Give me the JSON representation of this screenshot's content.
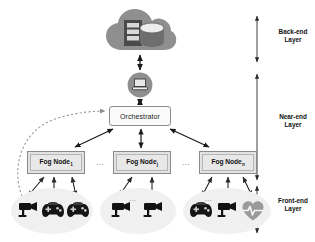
{
  "diagram": {
    "backend": {
      "cloud_icon": "cloud-icon",
      "server_icon": "server-rack-icon",
      "database_icon": "database-cylinder-icon"
    },
    "gateway": {
      "icon": "gateway-device-icon"
    },
    "orchestrator": {
      "label": "Orchestrator"
    },
    "fog_nodes": [
      {
        "name": "Fog Node",
        "subscript": "1"
      },
      {
        "name": "Fog Node",
        "subscript": "j"
      },
      {
        "name": "Fog Node",
        "subscript": "n"
      }
    ],
    "fog_separators": [
      "...",
      "..."
    ],
    "clusters": [
      {
        "devices": [
          "camera-icon",
          "gamepad-icon",
          "gamepad-icon"
        ],
        "ellipsis": ""
      },
      {
        "devices": [
          "camera-icon",
          "camera-icon"
        ],
        "ellipsis": "..."
      },
      {
        "devices": [
          "gamepad-icon",
          "camera-icon",
          "heart-monitor-icon"
        ],
        "ellipsis": "..."
      }
    ],
    "layers": [
      {
        "line1": "Back-end",
        "line2": "Layer"
      },
      {
        "line1": "Near-end",
        "line2": "Layer"
      },
      {
        "line1": "Front-end",
        "line2": "Layer"
      }
    ],
    "colors": {
      "cloud_fill": "#8f8f8f",
      "server_fill": "#4a4a4a",
      "database_fill": "#d9d9d9",
      "gateway_fill": "#8f8f8f",
      "fognode_fill": "#e2e2e2",
      "fognode_border": "#8a8a8a",
      "cluster_fill": "#f0f0f0",
      "device_dark": "#1a1a1a",
      "heart_gray": "#9a9a9a",
      "arrow": "#1a1a1a",
      "dashed_arrow": "#9a9a9a"
    }
  }
}
